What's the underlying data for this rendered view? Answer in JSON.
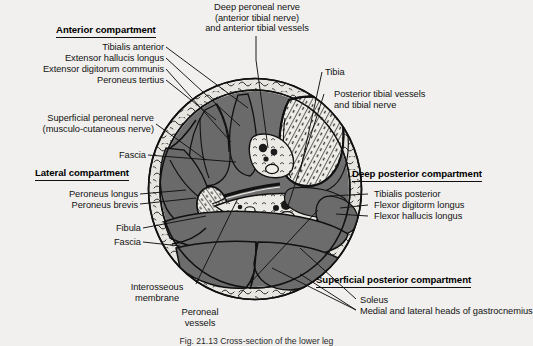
{
  "figure": {
    "title_hidden": "",
    "caption": "Fig. 21.13  Cross-section of the lower leg",
    "background_color": "#f1f0ee",
    "muscle_color": "#6f6f6f",
    "bone_color": "#e9e7e2",
    "fat_ring_color": "#e4e2dc",
    "line_color": "#111111"
  },
  "headings": {
    "anterior": "Anterior compartment",
    "lateral": "Lateral compartment",
    "deep_posterior": "Deep posterior compartment",
    "superficial_posterior": "Superficial posterior compartment"
  },
  "labels": {
    "top_center": {
      "line1": "Deep peroneal nerve",
      "line2": "(anterior tibial nerve)",
      "line3": "and anterior tibial vessels"
    },
    "anterior_group": [
      "Tibialis anterior",
      "Extensor hallucis longus",
      "Extensor digitorum communis",
      "Peroneus tertius"
    ],
    "superficial_peroneal": {
      "line1": "Superficial peroneal nerve",
      "line2": "(musculo-cutaneous nerve)"
    },
    "fascia_upper": "Fascia",
    "lateral_group": [
      "Peroneus longus",
      "Peroneus brevis"
    ],
    "fibula": "Fibula",
    "fascia_lower": "Fascia",
    "interosseous": {
      "line1": "Interosseous",
      "line2": "membrane"
    },
    "peroneal_vessels": {
      "line1": "Peroneal",
      "line2": "vessels"
    },
    "tibia": "Tibia",
    "posterior_tibial": {
      "line1": "Posterior tibial vessels",
      "line2": "and tibial nerve"
    },
    "deep_posterior_group": [
      "Tibialis posterior",
      "Flexor digitorm longus",
      "Flexor hallucis longus"
    ],
    "superficial_posterior_group": [
      "Soleus",
      "Medial and lateral heads of gastrocnemius"
    ]
  }
}
